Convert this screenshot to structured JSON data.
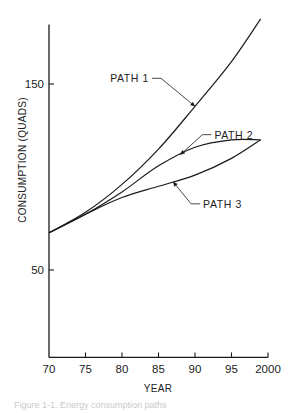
{
  "chart_data": {
    "type": "line",
    "title": "",
    "xlabel": "YEAR",
    "ylabel": "CONSUMPTION (QUADS)",
    "xlim": [
      1970,
      2000
    ],
    "ylim": [
      3,
      182
    ],
    "grid": false,
    "x_ticks": [
      {
        "value": 1970,
        "label": "70"
      },
      {
        "value": 1975,
        "label": "75"
      },
      {
        "value": 1980,
        "label": "80"
      },
      {
        "value": 1985,
        "label": "85"
      },
      {
        "value": 1990,
        "label": "90"
      },
      {
        "value": 1995,
        "label": "95"
      },
      {
        "value": 2000,
        "label": "2000"
      }
    ],
    "y_ticks": [
      {
        "value": 50,
        "label": "50"
      },
      {
        "value": 150,
        "label": "150"
      }
    ],
    "x": [
      1970,
      1975,
      1980,
      1985,
      1990,
      1995,
      1999
    ],
    "series": [
      {
        "name": "PATH 1",
        "values": [
          70,
          81,
          96,
          115,
          138,
          162,
          185
        ]
      },
      {
        "name": "PATH 2",
        "values": [
          70,
          80,
          92,
          106,
          116,
          120,
          120
        ]
      },
      {
        "name": "PATH 3",
        "values": [
          70,
          80,
          89,
          95,
          101,
          110,
          120
        ]
      }
    ],
    "annotations": [
      {
        "text": "PATH 1",
        "series": "PATH 1",
        "at_x": 1990
      },
      {
        "text": "PATH 2",
        "series": "PATH 2",
        "at_x": 1988
      },
      {
        "text": "PATH 3",
        "series": "PATH 3",
        "at_x": 1987
      }
    ],
    "line_color": "#1a1a1a"
  },
  "caption": "Figure 1-1. Energy consumption paths"
}
